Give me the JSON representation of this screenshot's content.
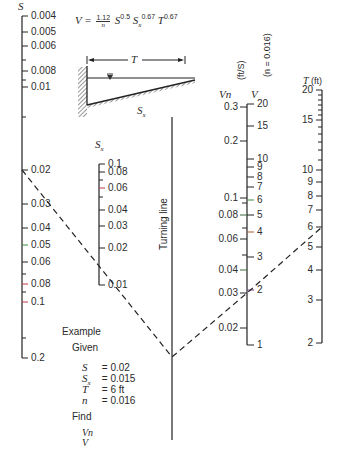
{
  "equation": {
    "lhs": "V =",
    "coef_num": "1.12",
    "coef_den": "n",
    "t1_base": "S",
    "t1_exp": "0.5",
    "t2_base": "S",
    "t2_sub": "x",
    "t2_exp": "0.67",
    "t3_base": "T",
    "t3_exp": "0.67"
  },
  "cross_section": {
    "width_label": "T",
    "slope_label": "Sx"
  },
  "scales": {
    "S": {
      "title": "S",
      "ticks": [
        {
          "label": "0.004",
          "y": 16
        },
        {
          "label": "0.005",
          "y": 32
        },
        {
          "label": "0.006",
          "y": 46
        },
        {
          "label": "",
          "y": 60
        },
        {
          "label": "0.008",
          "y": 71
        },
        {
          "label": "",
          "y": 80
        },
        {
          "label": "0.01",
          "y": 87
        },
        {
          "label": "",
          "y": 117
        },
        {
          "label": "0.02",
          "y": 170
        },
        {
          "label": "0.03",
          "y": 204
        },
        {
          "label": "0.04",
          "y": 228
        },
        {
          "label": "0.05",
          "y": 245,
          "color": "#3a8a3a"
        },
        {
          "label": "0.06",
          "y": 262
        },
        {
          "label": "",
          "y": 274
        },
        {
          "label": "0.08",
          "y": 284,
          "color": "#c0394a"
        },
        {
          "label": "",
          "y": 292
        },
        {
          "label": "0.1",
          "y": 302,
          "color": "#c0394a"
        },
        {
          "label": "",
          "y": 338
        },
        {
          "label": "0.2",
          "y": 358
        }
      ]
    },
    "Sx": {
      "title": "Sx",
      "ticks": [
        {
          "label": "0.1",
          "y": 164
        },
        {
          "label": "0.08",
          "y": 172
        },
        {
          "label": "",
          "y": 180
        },
        {
          "label": "0.06",
          "y": 188,
          "color": "#c0394a"
        },
        {
          "label": "",
          "y": 197
        },
        {
          "label": "0.04",
          "y": 210
        },
        {
          "label": "0.03",
          "y": 226
        },
        {
          "label": "0.02",
          "y": 248
        },
        {
          "label": "0.01",
          "y": 285
        }
      ]
    },
    "turning_line": {
      "label": "Turning line"
    },
    "Vn": {
      "title": "Vn",
      "unit_label": "(ft/S)",
      "ticks": [
        {
          "label": "0.3",
          "y": 107
        },
        {
          "label": "0.2",
          "y": 141
        },
        {
          "label": "0.1",
          "y": 198
        },
        {
          "label": "",
          "y": 203
        },
        {
          "label": "0.08",
          "y": 215,
          "color": "#3a6a3a"
        },
        {
          "label": "",
          "y": 228
        },
        {
          "label": "0.06",
          "y": 239
        },
        {
          "label": "",
          "y": 255
        },
        {
          "label": "0.04",
          "y": 270,
          "color": "#3a6a3a"
        },
        {
          "label": "0.03",
          "y": 293
        },
        {
          "label": "0.02",
          "y": 328
        }
      ]
    },
    "V": {
      "title": "V",
      "subtitle": "(n = 0.016)",
      "ticks": [
        {
          "label": "20",
          "y": 104
        },
        {
          "label": "15",
          "y": 126
        },
        {
          "label": "10",
          "y": 159
        },
        {
          "label": "9",
          "y": 167
        },
        {
          "label": "8",
          "y": 177
        },
        {
          "label": "7",
          "y": 187
        },
        {
          "label": "6",
          "y": 200,
          "color": "#3a8a3a"
        },
        {
          "label": "5",
          "y": 215
        },
        {
          "label": "4",
          "y": 232,
          "color": "#b05a2a"
        },
        {
          "label": "3",
          "y": 257
        },
        {
          "label": "2",
          "y": 290,
          "color": "#7a3a8a"
        },
        {
          "label": "1",
          "y": 345
        }
      ]
    },
    "T": {
      "title": "T",
      "unit": "(ft)",
      "ticks": [
        {
          "label": "20",
          "y": 90
        },
        {
          "label": "",
          "y": 95
        },
        {
          "label": "",
          "y": 100
        },
        {
          "label": "",
          "y": 105
        },
        {
          "label": "",
          "y": 110
        },
        {
          "label": "",
          "y": 115
        },
        {
          "label": "15",
          "y": 120
        },
        {
          "label": "",
          "y": 127
        },
        {
          "label": "",
          "y": 134
        },
        {
          "label": "",
          "y": 142
        },
        {
          "label": "",
          "y": 150
        },
        {
          "label": "",
          "y": 160
        },
        {
          "label": "10",
          "y": 170
        },
        {
          "label": "9",
          "y": 182
        },
        {
          "label": "8",
          "y": 196
        },
        {
          "label": "7",
          "y": 210
        },
        {
          "label": "6",
          "y": 227
        },
        {
          "label": "5",
          "y": 247
        },
        {
          "label": "4",
          "y": 270
        },
        {
          "label": "3",
          "y": 300
        },
        {
          "label": "2",
          "y": 343
        }
      ]
    }
  },
  "example": {
    "heading": "Example",
    "given_label": "Given",
    "given": [
      {
        "var": "S",
        "sub": "",
        "value": "= 0.02"
      },
      {
        "var": "S",
        "sub": "x",
        "value": "= 0.015"
      },
      {
        "var": "T",
        "sub": "",
        "value": "= 6 ft"
      },
      {
        "var": "n",
        "sub": "",
        "value": "= 0.016"
      }
    ],
    "find_label": "Find",
    "find": [
      "Vn",
      "V"
    ]
  }
}
